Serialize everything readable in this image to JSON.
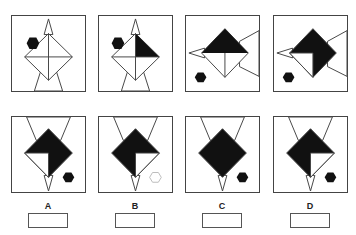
{
  "puzzle": {
    "type": "figure-sequence-reasoning",
    "sequence_panels": [
      {
        "index": 1,
        "hexagon": "filled",
        "hexagon_position": "top-left",
        "orientation": "spike-up",
        "black_quadrants": []
      },
      {
        "index": 2,
        "hexagon": "filled",
        "hexagon_position": "top-left",
        "orientation": "spike-up",
        "black_quadrants": [
          "top-right"
        ]
      },
      {
        "index": 3,
        "hexagon": "filled",
        "hexagon_position": "bottom-left",
        "orientation": "spike-left",
        "black_quadrants": [
          "top-left",
          "top-right"
        ]
      },
      {
        "index": 4,
        "hexagon": "filled",
        "hexagon_position": "bottom-left",
        "orientation": "spike-left",
        "black_quadrants": [
          "top-left",
          "top-right",
          "bottom-right"
        ]
      }
    ],
    "options": [
      {
        "label": "A",
        "hexagon": "filled",
        "hexagon_position": "bottom-right",
        "orientation": "spike-down",
        "white_quadrant": "bottom-left"
      },
      {
        "label": "B",
        "hexagon": "outline",
        "hexagon_position": "bottom-right",
        "orientation": "spike-down",
        "white_quadrant": "bottom-right"
      },
      {
        "label": "C",
        "hexagon": "filled",
        "hexagon_position": "bottom-right",
        "orientation": "spike-down",
        "white_quadrant": "none"
      },
      {
        "label": "D",
        "hexagon": "filled",
        "hexagon_position": "bottom-right",
        "orientation": "spike-down",
        "white_quadrant": "bottom-right"
      }
    ],
    "colors": {
      "fill": "#111111",
      "stroke": "#444444",
      "hexagon_outline": "#bbbbbb"
    }
  }
}
